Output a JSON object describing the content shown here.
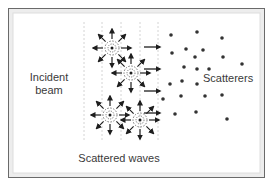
{
  "labels": {
    "incident_line1": "Incident",
    "incident_line2": "beam",
    "scatterers": "Scatterers",
    "scattered_waves": "Scattered waves"
  },
  "colors": {
    "frame_dark": "#6a6a6a",
    "frame_light": "#e8e8e8",
    "ink": "#1e1e1e",
    "wavefront": "#d4d4d4",
    "dot": "#333333"
  },
  "icons": {
    "arrow": "arrow-icon",
    "scatter_center": "dashed-circle-scatterer"
  },
  "scattering_sources": [
    {
      "id": 1
    },
    {
      "id": 2
    },
    {
      "id": 3
    },
    {
      "id": 4
    }
  ],
  "incident_arrows_count": 4,
  "scatterer_dots_count": 22
}
